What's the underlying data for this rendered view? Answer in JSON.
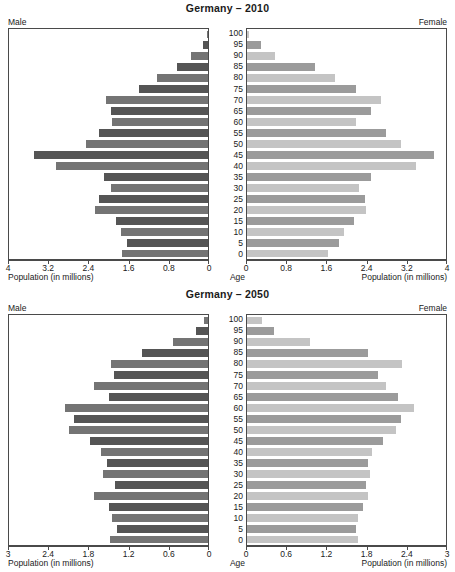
{
  "chart_data": [
    {
      "type": "bar",
      "title": "Germany – 2010",
      "subtitle": "",
      "orientation": "population-pyramid",
      "left_label": "Male",
      "right_label": "Female",
      "xlabel": "Population (in millions)",
      "ylabel": "Age",
      "grid": false,
      "legend_position": "none",
      "xlim": [
        0,
        4
      ],
      "xticks_left": [
        "4",
        "3.2",
        "2.4",
        "1.6",
        "0.8",
        "0"
      ],
      "xticks_right": [
        "0",
        "0.8",
        "1.6",
        "2.4",
        "3.2",
        "4"
      ],
      "xtick_values": [
        0,
        0.8,
        1.6,
        2.4,
        3.2,
        4
      ],
      "categories": [
        "100",
        "95",
        "90",
        "85",
        "80",
        "75",
        "70",
        "65",
        "60",
        "55",
        "50",
        "45",
        "40",
        "35",
        "30",
        "25",
        "20",
        "15",
        "10",
        "5",
        "0"
      ],
      "series": [
        {
          "name": "Male",
          "values": [
            0.03,
            0.1,
            0.35,
            0.62,
            1.03,
            1.38,
            2.05,
            1.95,
            1.93,
            2.2,
            2.45,
            3.5,
            3.05,
            2.1,
            1.95,
            2.2,
            2.27,
            1.85,
            1.75,
            1.62,
            1.72
          ]
        },
        {
          "name": "Female",
          "values": [
            0.04,
            0.28,
            0.56,
            1.37,
            1.77,
            2.2,
            2.7,
            2.5,
            2.2,
            2.8,
            3.1,
            3.75,
            3.4,
            2.5,
            2.25,
            2.38,
            2.4,
            2.15,
            1.95,
            1.85,
            1.63
          ]
        }
      ]
    },
    {
      "type": "bar",
      "title": "Germany – 2050",
      "subtitle": "",
      "orientation": "population-pyramid",
      "left_label": "Male",
      "right_label": "Female",
      "xlabel": "Population (in millions)",
      "ylabel": "Age",
      "grid": false,
      "legend_position": "none",
      "xlim": [
        0,
        3
      ],
      "xticks_left": [
        "3",
        "2.4",
        "1.8",
        "1.2",
        "0.6",
        "0"
      ],
      "xticks_right": [
        "0",
        "0.6",
        "1.2",
        "1.8",
        "2.4",
        "3"
      ],
      "xtick_values": [
        0,
        0.6,
        1.2,
        1.8,
        2.4,
        3
      ],
      "categories": [
        "100",
        "95",
        "90",
        "85",
        "80",
        "75",
        "70",
        "65",
        "60",
        "55",
        "50",
        "45",
        "40",
        "35",
        "30",
        "25",
        "20",
        "15",
        "10",
        "5",
        "0"
      ],
      "series": [
        {
          "name": "Male",
          "values": [
            0.06,
            0.18,
            0.53,
            1.0,
            1.46,
            1.42,
            1.72,
            1.5,
            2.16,
            2.02,
            2.1,
            1.78,
            1.62,
            1.52,
            1.58,
            1.4,
            1.72,
            1.5,
            1.45,
            1.37,
            1.48
          ]
        },
        {
          "name": "Female",
          "values": [
            0.22,
            0.4,
            0.95,
            1.83,
            2.33,
            1.97,
            2.1,
            2.28,
            2.52,
            2.32,
            2.25,
            2.05,
            1.88,
            1.82,
            1.85,
            1.8,
            1.83,
            1.75,
            1.68,
            1.64,
            1.67
          ]
        }
      ]
    }
  ],
  "panels": [
    {
      "title": "Germany – 2010",
      "male_label": "Male",
      "female_label": "Female",
      "age_caption": "Age",
      "left_caption": "Population (in millions)",
      "right_caption": "Population (in millions)"
    },
    {
      "title": "Germany – 2050",
      "male_label": "Male",
      "female_label": "Female",
      "age_caption": "Age",
      "left_caption": "Population (in millions)",
      "right_caption": "Population (in millions)"
    }
  ],
  "colors": {
    "male_dark": "#555555",
    "male_light": "#747474",
    "female_dark": "#9b9b9b",
    "female_light": "#c4c4c4",
    "axis": "#4a4a4a",
    "text": "#1a1a1a"
  }
}
